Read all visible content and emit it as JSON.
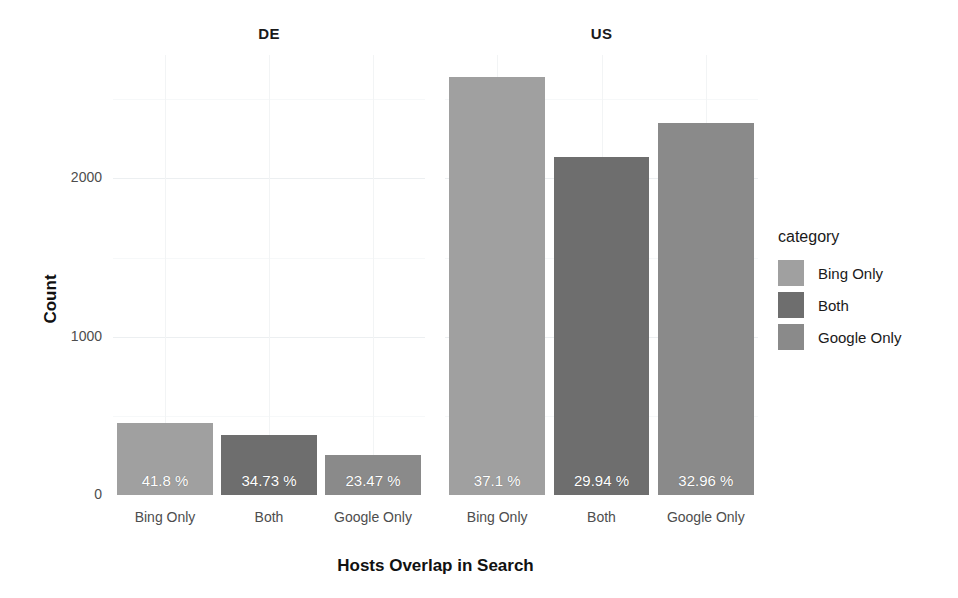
{
  "chart_data": {
    "type": "bar",
    "title": "",
    "xlabel": "Hosts Overlap in Search",
    "ylabel": "Count",
    "ylim": [
      0,
      2780
    ],
    "yticks": [
      0,
      1000,
      2000
    ],
    "ytick_labels": [
      "0",
      "1000",
      "2000"
    ],
    "grid": true,
    "legend_position": "right",
    "legend_title": "category",
    "facet_labels": [
      "DE",
      "US"
    ],
    "categories": [
      "Bing Only",
      "Both",
      "Google Only"
    ],
    "series": [
      {
        "name": "DE",
        "values": [
          455,
          378,
          255
        ],
        "data_labels": [
          "41.8 %",
          "34.73 %",
          "23.47 %"
        ]
      },
      {
        "name": "US",
        "values": [
          2644,
          2134,
          2350
        ],
        "data_labels": [
          "37.1 %",
          "29.94 %",
          "32.96 %"
        ]
      }
    ],
    "colors": {
      "Bing Only": "#a0a0a0",
      "Both": "#6e6e6e",
      "Google Only": "#8a8a8a"
    }
  },
  "axes": {
    "y_title": "Count",
    "x_title": "Hosts Overlap in Search",
    "y_ticks": [
      {
        "label": "2000",
        "value": 2000
      },
      {
        "label": "1000",
        "value": 1000
      },
      {
        "label": "0",
        "value": 0
      }
    ]
  },
  "facets": [
    {
      "label": "DE",
      "bars": [
        {
          "category": "Bing Only",
          "value": 455,
          "label": "41.8 %",
          "color": "#a0a0a0"
        },
        {
          "category": "Both",
          "value": 378,
          "label": "34.73 %",
          "color": "#6e6e6e"
        },
        {
          "category": "Google Only",
          "value": 255,
          "label": "23.47 %",
          "color": "#8a8a8a"
        }
      ],
      "xticks": [
        "Bing Only",
        "Both",
        "Google Only"
      ]
    },
    {
      "label": "US",
      "bars": [
        {
          "category": "Bing Only",
          "value": 2644,
          "label": "37.1 %",
          "color": "#a0a0a0"
        },
        {
          "category": "Both",
          "value": 2134,
          "label": "29.94 %",
          "color": "#6e6e6e"
        },
        {
          "category": "Google Only",
          "value": 2350,
          "label": "32.96 %",
          "color": "#8a8a8a"
        }
      ],
      "xticks": [
        "Bing Only",
        "Both",
        "Google Only"
      ]
    }
  ],
  "legend": {
    "title": "category",
    "items": [
      {
        "label": "Bing Only",
        "color": "#a0a0a0"
      },
      {
        "label": "Both",
        "color": "#6e6e6e"
      },
      {
        "label": "Google Only",
        "color": "#8a8a8a"
      }
    ]
  }
}
